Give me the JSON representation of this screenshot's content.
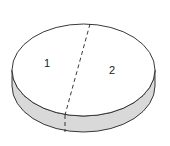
{
  "diagram": {
    "type": "cylinder-disk",
    "regions": [
      {
        "label": "1"
      },
      {
        "label": "2"
      }
    ],
    "colors": {
      "top": "#ffffff",
      "side": "#d9d9d9",
      "stroke": "#222222"
    }
  }
}
